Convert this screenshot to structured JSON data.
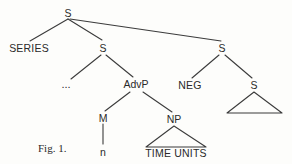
{
  "figure": {
    "caption": "Fig. 1.",
    "ink_color": "#3b3b3b",
    "text_color": "#2a2a2a",
    "background": "#fdfdfb"
  },
  "nodes": {
    "root_s": "S",
    "series": "SERIES",
    "left_s": "S",
    "ellipsis": "...",
    "advp": "AdvP",
    "m": "M",
    "n": "n",
    "np": "NP",
    "time_units": "TIME UNITS",
    "right_s": "S",
    "neg": "NEG",
    "embedded_s": "S"
  }
}
